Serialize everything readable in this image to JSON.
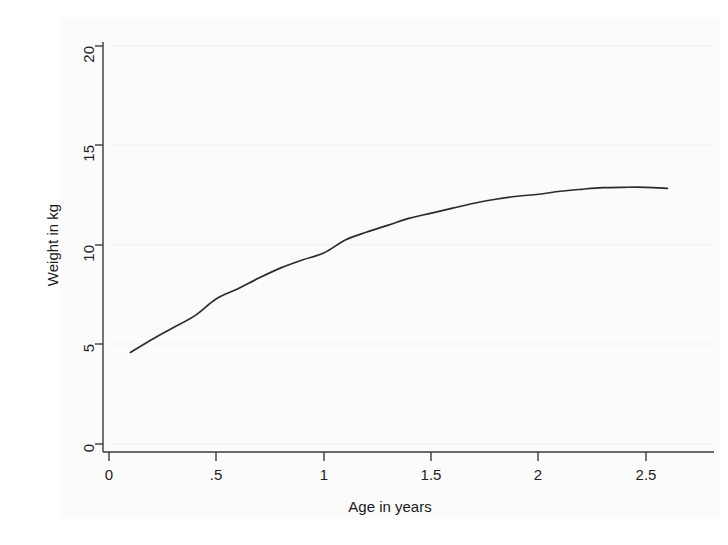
{
  "figure": {
    "name": "weight-for-age-growth-curve",
    "background_color": "#ffffff",
    "axis_color": "#3a3a3a",
    "grid_color": "#f0f0f0",
    "curve_color": "#2b2b2b"
  },
  "chart_data": {
    "type": "line",
    "title": "",
    "subtitle": "",
    "xlabel": "Age in years",
    "ylabel": "Weight in kg",
    "xlim": [
      0,
      2.72
    ],
    "ylim": [
      0,
      20
    ],
    "xticks": [
      0,
      0.5,
      1,
      1.5,
      2,
      2.5
    ],
    "xticklabels": [
      "0",
      ".5",
      "1",
      "1.5",
      "2",
      "2.5"
    ],
    "yticks": [
      0,
      5,
      10,
      15,
      20
    ],
    "yticklabels": [
      "0",
      "5",
      "10",
      "15",
      "20"
    ],
    "grid": true,
    "grid_axis": "y",
    "legend": false,
    "legend_position": "none",
    "series": [
      {
        "name": "Predicted weight",
        "x": [
          0.1,
          0.2,
          0.3,
          0.4,
          0.5,
          0.6,
          0.7,
          0.8,
          0.9,
          1.0,
          1.1,
          1.2,
          1.3,
          1.4,
          1.5,
          1.6,
          1.7,
          1.8,
          1.9,
          2.0,
          2.1,
          2.2,
          2.3,
          2.4,
          2.5,
          2.6
        ],
        "y": [
          4.6,
          5.25,
          5.85,
          6.45,
          7.3,
          7.8,
          8.35,
          8.85,
          9.25,
          9.6,
          10.25,
          10.65,
          11.0,
          11.35,
          11.6,
          11.85,
          12.1,
          12.3,
          12.45,
          12.55,
          12.7,
          12.8,
          12.88,
          12.9,
          12.9,
          12.85
        ]
      }
    ],
    "annotations": []
  },
  "axes": {
    "x_axis_name": "x-axis",
    "y_axis_name": "y-axis"
  }
}
